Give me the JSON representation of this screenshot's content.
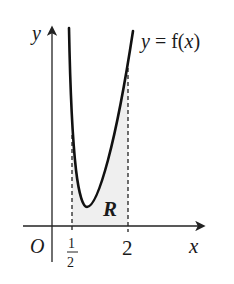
{
  "figure": {
    "function_label": "y = f(x)",
    "function_label_parts": {
      "y": "y",
      "eq": " = f(",
      "x": "x",
      "close": ")"
    },
    "axes": {
      "x_label": "x",
      "y_label": "y",
      "origin_label": "O"
    },
    "ticks": [
      {
        "value": 0.5,
        "numerator": "1",
        "denominator": "2"
      },
      {
        "value": 2,
        "label": "2"
      }
    ],
    "region_label": "R",
    "region_fill": "#efefef",
    "curve_color": "#111111",
    "axis_color": "#222222"
  }
}
